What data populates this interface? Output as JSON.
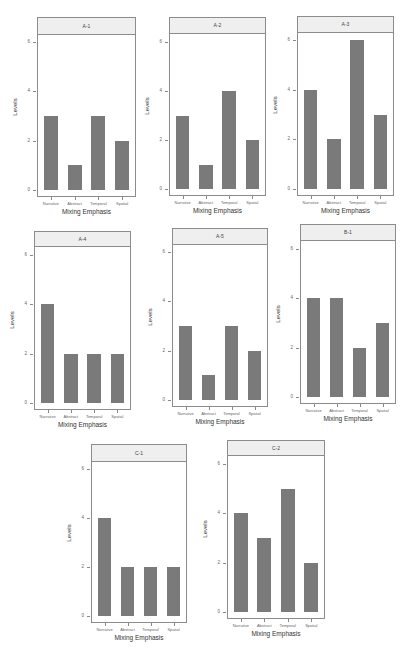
{
  "chart_data": [
    {
      "type": "bar",
      "title": "A-1",
      "categories": [
        "Narrative",
        "Abstract",
        "Temporal",
        "Spatial"
      ],
      "values": [
        3,
        1,
        3,
        2
      ],
      "xlabel": "Mixing Emphasis",
      "ylabel": "Levels",
      "ylim": [
        0,
        6
      ],
      "yticks": [
        0,
        2,
        4,
        6
      ]
    },
    {
      "type": "bar",
      "title": "A-2",
      "categories": [
        "Narrative",
        "Abstract",
        "Temporal",
        "Spatial"
      ],
      "values": [
        3,
        1,
        4,
        2
      ],
      "xlabel": "Mixing Emphasis",
      "ylabel": "Levels",
      "ylim": [
        0,
        6
      ],
      "yticks": [
        0,
        2,
        4,
        6
      ]
    },
    {
      "type": "bar",
      "title": "A-3",
      "categories": [
        "Narrative",
        "Abstract",
        "Temporal",
        "Spatial"
      ],
      "values": [
        4,
        2,
        6,
        3
      ],
      "xlabel": "Mixing Emphasis",
      "ylabel": "Levels",
      "ylim": [
        0,
        6
      ],
      "yticks": [
        0,
        2,
        4,
        6
      ]
    },
    {
      "type": "bar",
      "title": "A-4",
      "categories": [
        "Narrative",
        "Abstract",
        "Temporal",
        "Spatial"
      ],
      "values": [
        4,
        2,
        2,
        2
      ],
      "xlabel": "Mixing Emphasis",
      "ylabel": "Levels",
      "ylim": [
        0,
        6
      ],
      "yticks": [
        0,
        2,
        4,
        6
      ]
    },
    {
      "type": "bar",
      "title": "A-5",
      "categories": [
        "Narrative",
        "Abstract",
        "Temporal",
        "Spatial"
      ],
      "values": [
        3,
        1,
        3,
        2
      ],
      "xlabel": "Mixing Emphasis",
      "ylabel": "Levels",
      "ylim": [
        0,
        6
      ],
      "yticks": [
        0,
        2,
        4,
        6
      ]
    },
    {
      "type": "bar",
      "title": "B-1",
      "categories": [
        "Narrative",
        "Abstract",
        "Temporal",
        "Spatial"
      ],
      "values": [
        4,
        4,
        2,
        3
      ],
      "xlabel": "Mixing Emphasis",
      "ylabel": "Levels",
      "ylim": [
        0,
        6
      ],
      "yticks": [
        0,
        2,
        4,
        6
      ]
    },
    {
      "type": "bar",
      "title": "C-1",
      "categories": [
        "Narrative",
        "Abstract",
        "Temporal",
        "Spatial"
      ],
      "values": [
        4,
        2,
        2,
        2
      ],
      "xlabel": "Mixing Emphasis",
      "ylabel": "Levels",
      "ylim": [
        0,
        6
      ],
      "yticks": [
        0,
        2,
        4,
        6
      ]
    },
    {
      "type": "bar",
      "title": "C-2",
      "categories": [
        "Narrative",
        "Abstract",
        "Temporal",
        "Spatial"
      ],
      "values": [
        4,
        3,
        5,
        2
      ],
      "xlabel": "Mixing Emphasis",
      "ylabel": "Levels",
      "ylim": [
        0,
        6
      ],
      "yticks": [
        0,
        2,
        4,
        6
      ]
    }
  ],
  "style": {
    "bar_color": "#7a7a7a",
    "strip_color": "#efefef",
    "border_color": "#8c8c8c"
  },
  "layout": [
    {
      "x": 37,
      "y": 17,
      "w": 99,
      "strip_h": 18,
      "six_y": 42,
      "zero_y": 190,
      "bottom_y": 197
    },
    {
      "x": 169,
      "y": 17,
      "w": 97,
      "strip_h": 17,
      "six_y": 42,
      "zero_y": 189,
      "bottom_y": 196
    },
    {
      "x": 297,
      "y": 16,
      "w": 97,
      "strip_h": 17,
      "six_y": 40,
      "zero_y": 189,
      "bottom_y": 196
    },
    {
      "x": 34,
      "y": 231,
      "w": 97,
      "strip_h": 16,
      "six_y": 255,
      "zero_y": 403,
      "bottom_y": 410
    },
    {
      "x": 172,
      "y": 228,
      "w": 96,
      "strip_h": 17,
      "six_y": 252,
      "zero_y": 400,
      "bottom_y": 407
    },
    {
      "x": 300,
      "y": 224,
      "w": 96,
      "strip_h": 17,
      "six_y": 249,
      "zero_y": 397,
      "bottom_y": 404
    },
    {
      "x": 91,
      "y": 444,
      "w": 96,
      "strip_h": 18,
      "six_y": 469,
      "zero_y": 616,
      "bottom_y": 623
    },
    {
      "x": 227,
      "y": 440,
      "w": 98,
      "strip_h": 16,
      "six_y": 464,
      "zero_y": 612,
      "bottom_y": 619
    }
  ]
}
